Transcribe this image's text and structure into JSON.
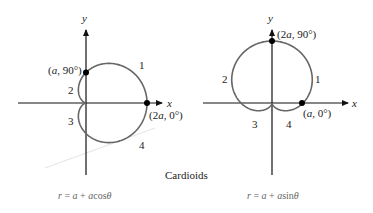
{
  "figure": {
    "title": "Cardioids",
    "left": {
      "equation": "r = a + a cos θ",
      "eq_parts": {
        "r": "r",
        "eq": " = ",
        "a1": "a",
        "plus": " + ",
        "a2": "a",
        "fn": "cos",
        "theta": "θ"
      },
      "axis_x": "x",
      "axis_y": "y",
      "points": [
        {
          "label_pre": "(",
          "label_var": "a",
          "label_post": ", 90°)"
        },
        {
          "label_pre": "(2",
          "label_var": "a",
          "label_post": ", 0°)"
        }
      ],
      "regions": [
        "1",
        "2",
        "3",
        "4"
      ]
    },
    "right": {
      "equation": "r = a + a sin θ",
      "eq_parts": {
        "r": "r",
        "eq": " = ",
        "a1": "a",
        "plus": " + ",
        "a2": "a",
        "fn": "sin",
        "theta": "θ"
      },
      "axis_x": "x",
      "axis_y": "y",
      "points": [
        {
          "label_pre": "(2",
          "label_var": "a",
          "label_post": ", 90°)"
        },
        {
          "label_pre": "(",
          "label_var": "a",
          "label_post": ", 0°)"
        }
      ],
      "regions": [
        "1",
        "2",
        "3",
        "4"
      ]
    },
    "colors": {
      "curve": "#666666",
      "axis": "#111111",
      "point": "#000000"
    }
  }
}
